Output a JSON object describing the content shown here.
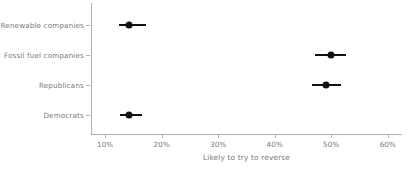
{
  "chart_data": {
    "type": "scatter",
    "title": "",
    "subtitle": "",
    "xlabel": "Likely to try to reverse",
    "ylabel": "",
    "xlim": [
      7.5,
      62.5
    ],
    "ylim": [
      0,
      4
    ],
    "grid": false,
    "legend": null,
    "x_tick_labels": [
      "10%",
      "20%",
      "30%",
      "40%",
      "50%",
      "60%"
    ],
    "x_tick_values": [
      10,
      20,
      30,
      40,
      50,
      60
    ],
    "categories": [
      "Renewable companies",
      "Fossil fuel companies",
      "Republicans",
      "Democrats"
    ],
    "values": [
      14.2,
      49.9,
      49.1,
      14.2
    ],
    "error_low": [
      12.5,
      47.2,
      46.5,
      12.6
    ],
    "error_high": [
      17.2,
      52.6,
      51.7,
      16.5
    ],
    "points": [
      {
        "label": "Renewable companies",
        "value": 14.2,
        "low": 12.5,
        "high": 17.2
      },
      {
        "label": "Fossil fuel companies",
        "value": 49.9,
        "low": 47.2,
        "high": 52.6
      },
      {
        "label": "Republicans",
        "value": 49.1,
        "low": 46.5,
        "high": 51.7
      },
      {
        "label": "Democrats",
        "value": 14.2,
        "low": 12.6,
        "high": 16.5
      }
    ],
    "marker_color": "#111111",
    "axis_color": "#b0b0b0",
    "text_color": "#7a7a7a"
  }
}
